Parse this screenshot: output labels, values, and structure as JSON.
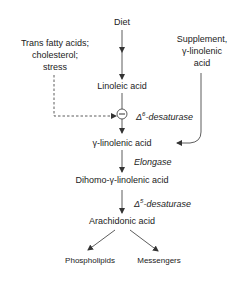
{
  "diagram": {
    "nodes": {
      "diet": "Diet",
      "linoleic": "Linoleic acid",
      "gla": "γ-linolenic acid",
      "dgla": "Dihomo-γ-linolenic acid",
      "arachidonic": "Arachidonic acid",
      "phospholipids": "Phospholipids",
      "messengers": "Messengers"
    },
    "inhibitors": {
      "line1": "Trans fatty acids;",
      "line2": "cholesterol;",
      "line3": "stress"
    },
    "supplement": {
      "line1": "Supplement,",
      "line2": "γ-linolenic",
      "line3": "acid"
    },
    "enzymes": {
      "d6_prefix": "Δ",
      "d6_sup": "6",
      "d6_suffix": "-desaturase",
      "elongase": "Elongase",
      "d5_prefix": "Δ",
      "d5_sup": "5",
      "d5_suffix": "-desaturase"
    },
    "inhibition_symbol": "−",
    "colors": {
      "line": "#333333",
      "text": "#222222",
      "background": "#ffffff"
    }
  }
}
